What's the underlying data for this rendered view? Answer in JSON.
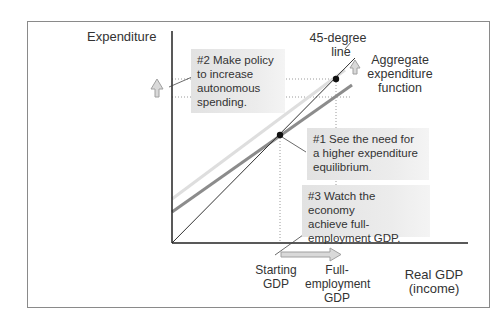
{
  "diagram": {
    "y_axis_label": "Expenditure",
    "x_axis_label_line1": "Real GDP",
    "x_axis_label_line2": "(income)",
    "line_45_label_line1": "45-degree",
    "line_45_label_line2": "line",
    "ae_label_line1": "Aggregate",
    "ae_label_line2": "expenditure",
    "ae_label_line3": "function",
    "x_ticks": {
      "starting_line1": "Starting",
      "starting_line2": "GDP",
      "full_line1": "Full-",
      "full_line2": "employment",
      "full_line3": "GDP"
    },
    "callouts": [
      {
        "id": "step1",
        "lines": [
          "#1 See the need for",
          "a higher expenditure",
          "equilibrium."
        ]
      },
      {
        "id": "step2",
        "lines": [
          "#2 Make policy",
          "to increase",
          "autonomous",
          "spending."
        ]
      },
      {
        "id": "step3",
        "lines": [
          "#3 Watch the economy",
          "achieve full-",
          "employment GDP."
        ]
      }
    ],
    "colors": {
      "axis": "#222222",
      "line_45": "#333333",
      "ae_original": "#8c8c8c",
      "ae_shifted": "#dcdcdc",
      "arrow_fill": "#d9d9d9",
      "arrow_stroke": "#a0a0a0",
      "callout_bg": "#e6e6e6"
    }
  }
}
